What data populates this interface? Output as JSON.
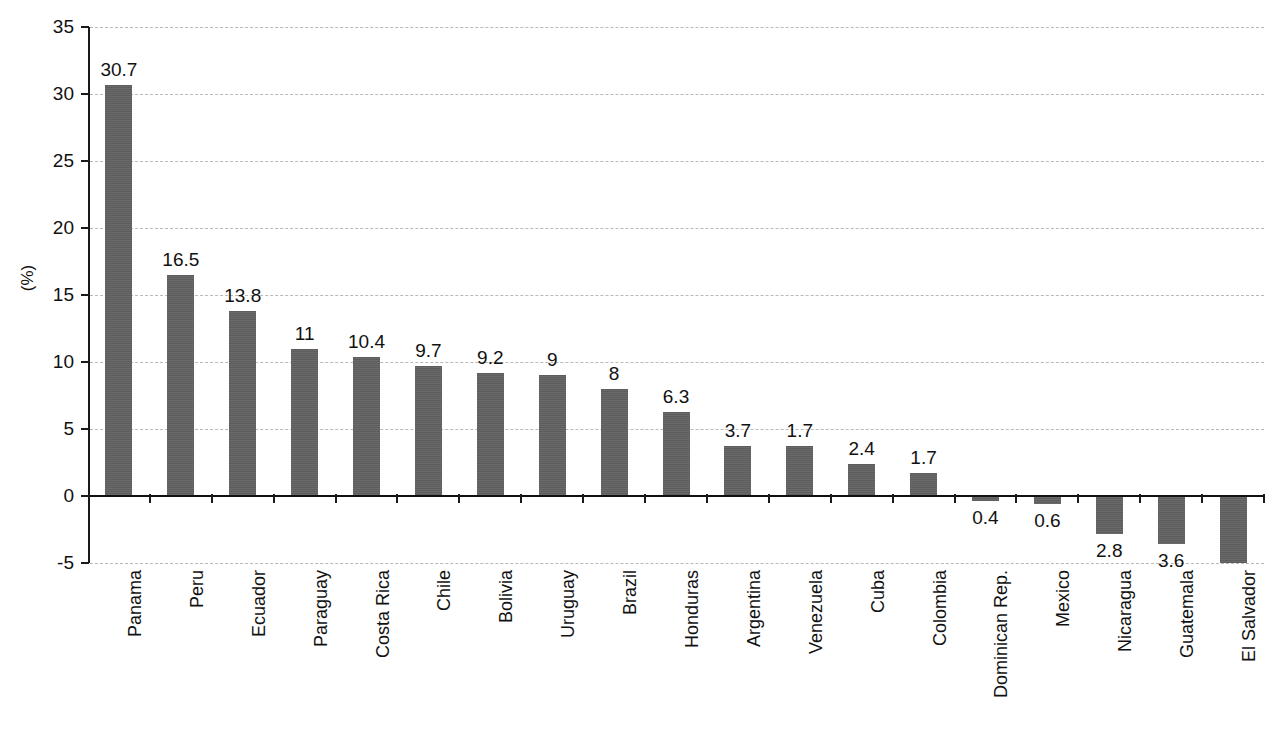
{
  "chart_data": {
    "type": "bar",
    "title": "",
    "subtitle": "",
    "xlabel": "",
    "ylabel": "(%)",
    "ylim": [
      -5,
      35
    ],
    "yticks": [
      -5,
      0,
      5,
      10,
      15,
      20,
      25,
      30,
      35
    ],
    "ytick_labels": [
      "-5",
      "0",
      "5",
      "10",
      "15",
      "20",
      "25",
      "30",
      "35"
    ],
    "grid": true,
    "grid_axis": "y",
    "legend": false,
    "legend_position": "none",
    "bar_color": "#5d5d5d",
    "axis_color": "#111111",
    "gridline_color": "#b9b9b9",
    "categories": [
      "Panama",
      "Peru",
      "Ecuador",
      "Paraguay",
      "Costa Rica",
      "Chile",
      "Bolivia",
      "Uruguay",
      "Brazil",
      "Honduras",
      "Argentina",
      "Venezuela",
      "Cuba",
      "Colombia",
      "Dominican Rep.",
      "Mexico",
      "Nicaragua",
      "Guatemala",
      "El Salvador"
    ],
    "values": [
      30.7,
      16.5,
      13.8,
      11,
      10.4,
      9.7,
      9.2,
      9,
      8,
      6.3,
      3.7,
      3.7,
      2.4,
      1.7,
      -0.4,
      -0.6,
      -2.8,
      -3.6,
      -5
    ],
    "data_labels": [
      "30.7",
      "16.5",
      "13.8",
      "11",
      "10.4",
      "9.7",
      "9.2",
      "9",
      "8",
      "6.3",
      "3.7",
      "1.7",
      "2.4",
      "1.7",
      "0.4",
      "0.6",
      "2.8",
      "3.6",
      ""
    ]
  }
}
